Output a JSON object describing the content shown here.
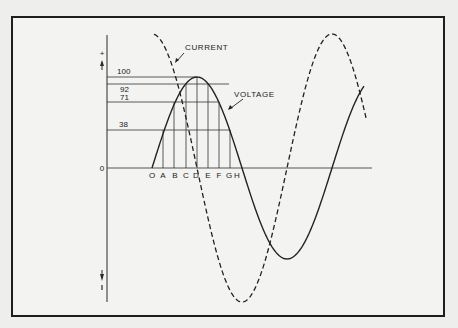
{
  "diagram": {
    "y_axis_label": "AMPLITUDE",
    "plus_sign": "+",
    "minus_sign": "−",
    "zero_label": "0",
    "curve_labels": {
      "current": "CURRENT",
      "voltage": "VOLTAGE"
    },
    "amplitude_levels": [
      {
        "label": "100",
        "value": 100
      },
      {
        "label": "92",
        "value": 92
      },
      {
        "label": "71",
        "value": 71
      },
      {
        "label": "38",
        "value": 38
      }
    ],
    "x_points": [
      "O",
      "A",
      "B",
      "C",
      "D",
      "E",
      "F",
      "G",
      "H"
    ],
    "colors": {
      "line": "#2a2a2a",
      "background": "#f3f3f1",
      "frame": "#1e1e1e"
    }
  }
}
